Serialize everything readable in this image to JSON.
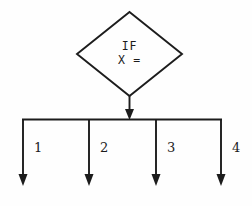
{
  "diagram": {
    "type": "flowchart-decision",
    "background_color": "#fefefe",
    "line_color": "#1c1c1c",
    "decision_node": {
      "shape": "diamond",
      "line1": "IF",
      "line2": "X ="
    },
    "branches": [
      {
        "label": "1"
      },
      {
        "label": "2"
      },
      {
        "label": "3"
      },
      {
        "label": "4"
      }
    ]
  }
}
